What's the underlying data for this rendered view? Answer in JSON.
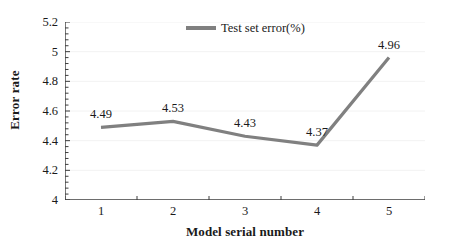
{
  "chart_data": {
    "type": "line",
    "title": "",
    "xlabel": "Model serial number",
    "ylabel": "Error rate",
    "categories": [
      "1",
      "2",
      "3",
      "4",
      "5"
    ],
    "series": [
      {
        "name": "Test set error(%)",
        "color": "#808080",
        "values": [
          4.49,
          4.53,
          4.43,
          4.37,
          4.96
        ],
        "point_labels": [
          "4.49",
          "4.53",
          "4.43",
          "4.37",
          "4.96"
        ]
      }
    ],
    "ylim": [
      4,
      5.2
    ],
    "ytick_labels": [
      "4",
      "4.2",
      "4.4",
      "4.6",
      "4.8",
      "5",
      "5.2"
    ],
    "ytick_values": [
      4,
      4.2,
      4.4,
      4.6,
      4.8,
      5,
      5.2
    ],
    "minor_ticks_per_interval": 5,
    "grid": true,
    "grid_color": "#f2f2f2",
    "legend_position": "top-center",
    "axis_color": "#3d3d3d",
    "background": "#ffffff"
  },
  "legend": {
    "entry_label": "Test set error(%)"
  }
}
